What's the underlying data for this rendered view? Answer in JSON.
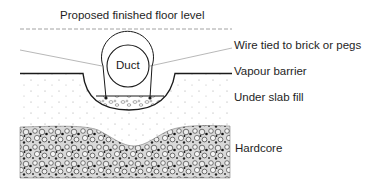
{
  "figure": {
    "labels": {
      "floor_level": "Proposed finished floor level",
      "wire": "Wire tied to brick or pegs",
      "vapour_barrier": "Vapour barrier",
      "under_slab_fill": "Under slab fill",
      "hardcore": "Hardcore",
      "duct": "Duct"
    },
    "layers": [
      {
        "name": "Proposed finished floor level",
        "style": "dashed line"
      },
      {
        "name": "Vapour barrier",
        "style": "solid line with trench depression"
      },
      {
        "name": "Under slab fill",
        "style": "sparse dot stipple"
      },
      {
        "name": "Hardcore",
        "style": "dense aggregate texture"
      }
    ],
    "colors": {
      "ink": "#1a1a1a",
      "background": "#ffffff",
      "leader": "#8a8a8a"
    }
  }
}
